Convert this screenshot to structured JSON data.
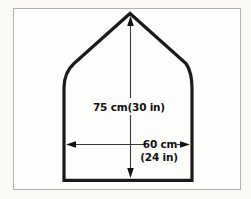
{
  "diagram": {
    "labels": {
      "height": "75 cm(30 in)",
      "width_line1": "60 cm",
      "width_line2": "(24 in)"
    },
    "dimensions": {
      "height_cm": 75,
      "height_in": 30,
      "width_cm": 60,
      "width_in": 24
    }
  },
  "colors": {
    "outline": "#1a1a1a",
    "dimension_line": "#3a3a3a",
    "arrowhead": "#111111",
    "text": "#111111",
    "frame_border": "#b3b1ac",
    "panel_background": "#fdfdfc",
    "page_background": "#faf9f6"
  }
}
